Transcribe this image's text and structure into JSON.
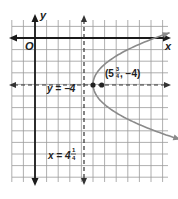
{
  "chart_data": {
    "type": "line",
    "title": "",
    "xlabel": "x",
    "ylabel": "y",
    "origin_label": "O",
    "grid": true,
    "xlim": [
      -2,
      11
    ],
    "ylim": [
      -11,
      1
    ],
    "series": [
      {
        "name": "parabola",
        "equation": "(y + 4)^2 = 3(x - 5)",
        "vertex": [
          5,
          -4
        ],
        "opens": "right",
        "color": "#888888"
      },
      {
        "name": "axis of symmetry",
        "label": "y = −4",
        "equation": "y = -4",
        "style": "dashed"
      },
      {
        "name": "directrix",
        "label_main": "x = 4",
        "label_num": "1",
        "label_den": "4",
        "equation": "x = 4.25",
        "style": "dashed"
      }
    ],
    "points": [
      {
        "name": "focus",
        "x": 5.75,
        "y": -4,
        "label_prefix": "(5",
        "label_num": "3",
        "label_den": "4",
        "label_suffix": ", −4)"
      },
      {
        "name": "vertex",
        "x": 5,
        "y": -4
      }
    ]
  },
  "colors": {
    "grid": "#9a9a9a",
    "axis": "#1a1a1a",
    "curve": "#8a8a8a",
    "dashed": "#333333"
  }
}
